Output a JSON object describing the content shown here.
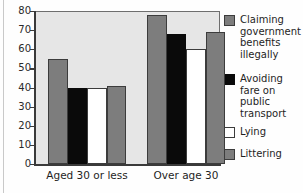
{
  "chart_data": {
    "type": "bar",
    "title": "",
    "xlabel": "",
    "ylabel": "",
    "ylim": [
      0,
      80
    ],
    "yticks": [
      0,
      10,
      20,
      30,
      40,
      50,
      60,
      70,
      80
    ],
    "grid": false,
    "legend_position": "right",
    "categories": [
      "Aged 30 or less",
      "Over age 30"
    ],
    "series": [
      {
        "name": "Claiming government benefits illegally",
        "legend_label": "Claiming\ngovernment\nbenefits\nillegally",
        "color": "#7d7d7d",
        "swatch": "gray",
        "values": [
          55,
          78
        ]
      },
      {
        "name": "Avoiding fare on public transport",
        "legend_label": "Avoiding\nfare on\npublic\ntransport",
        "color": "#0a0a0a",
        "swatch": "black",
        "values": [
          40,
          68
        ]
      },
      {
        "name": "Lying",
        "legend_label": "Lying",
        "color": "#ffffff",
        "swatch": "white",
        "values": [
          40,
          60
        ]
      },
      {
        "name": "Littering",
        "legend_label": "Littering",
        "color": "#7d7d7d",
        "swatch": "gray",
        "values": [
          41,
          69
        ]
      }
    ]
  },
  "colors": {
    "panel_background": "#e6e6e6",
    "axis": "#3a3a3a",
    "gray_bar": "#7d7d7d",
    "black_bar": "#0a0a0a",
    "white_bar": "#ffffff"
  }
}
